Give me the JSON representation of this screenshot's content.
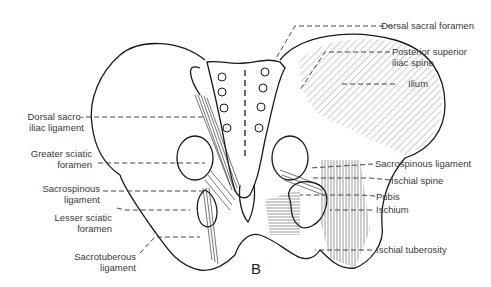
{
  "figure": {
    "panel_letter": "B",
    "view": "Posterior view of pelvis with ligaments",
    "labels_left": [
      {
        "id": "dorsal-sacroiliac-ligament",
        "line1": "Dorsal sacro-",
        "line2": "iliac ligament"
      },
      {
        "id": "greater-sciatic-foramen",
        "line1": "Greater sciatic",
        "line2": "foramen"
      },
      {
        "id": "sacrospinous-ligament-left",
        "line1": "Sacrospinous",
        "line2": "ligament"
      },
      {
        "id": "lesser-sciatic-foramen",
        "line1": "Lesser sciatic",
        "line2": "foramen"
      },
      {
        "id": "sacrotuberous-ligament",
        "line1": "Sacrotuberous",
        "line2": "ligament"
      }
    ],
    "labels_right": [
      {
        "id": "dorsal-sacral-foramen",
        "line1": "Dorsal sacral foramen"
      },
      {
        "id": "posterior-superior-iliac-spine",
        "line1": "Posterior superior",
        "line2": "iliac spine"
      },
      {
        "id": "ilium",
        "line1": "Ilium"
      },
      {
        "id": "sacrospinous-ligament-right",
        "line1": "Sacrospinous ligament"
      },
      {
        "id": "ischial-spine",
        "line1": "Ischial spine"
      },
      {
        "id": "pubis",
        "line1": "Pubis"
      },
      {
        "id": "ischium",
        "line1": "Ischium"
      },
      {
        "id": "ischial-tuberosity",
        "line1": "Ischial tuberosity"
      }
    ],
    "colors": {
      "line": "#1a1a1a",
      "label_text": "#3a3a3a",
      "background": "#ffffff"
    }
  }
}
